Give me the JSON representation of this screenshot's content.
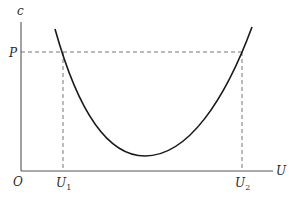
{
  "diagram": {
    "type": "u-shaped cost curve",
    "axes": {
      "y_label": "c",
      "x_label": "U",
      "origin_label": "O"
    },
    "levels": {
      "price_label": "P"
    },
    "x_markers": [
      {
        "label": "U",
        "subscript": "1"
      },
      {
        "label": "U",
        "subscript": "2"
      }
    ],
    "colors": {
      "curve": "#1a1a1a",
      "axis": "#555555",
      "dashed": "#666666"
    }
  }
}
